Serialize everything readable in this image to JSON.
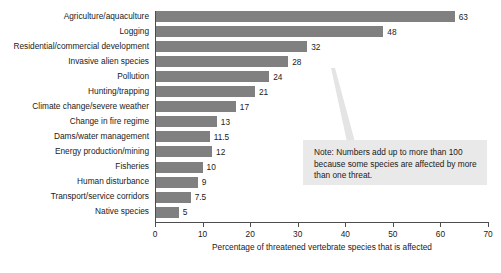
{
  "chart_data": {
    "type": "bar",
    "orientation": "horizontal",
    "title": "",
    "xlabel": "Percentage of threatened vertebrate species that is affected",
    "ylabel": "",
    "xlim": [
      0,
      70
    ],
    "xticks": [
      0,
      10,
      20,
      30,
      40,
      50,
      60,
      70
    ],
    "grid": false,
    "legend": null,
    "bar_color": "#808080",
    "categories": [
      "Agriculture/aquaculture",
      "Logging",
      "Residential/commercial development",
      "Invasive alien species",
      "Pollution",
      "Hunting/trapping",
      "Climate change/severe weather",
      "Change in fire regime",
      "Dams/water management",
      "Energy production/mining",
      "Fisheries",
      "Human disturbance",
      "Transport/service corridors",
      "Native species"
    ],
    "values": [
      63,
      48,
      32,
      28,
      24,
      21,
      17,
      13,
      11.5,
      12,
      10,
      9,
      7.5,
      5
    ],
    "value_labels": [
      "63",
      "48",
      "32",
      "28",
      "24",
      "21",
      "17",
      "13",
      "11.5",
      "12",
      "10",
      "9",
      "7.5",
      "5"
    ],
    "annotation": {
      "text": "Note: Numbers add up to more than 100 because some species are affected by more than one threat.",
      "background": "#e9e9e9"
    }
  }
}
